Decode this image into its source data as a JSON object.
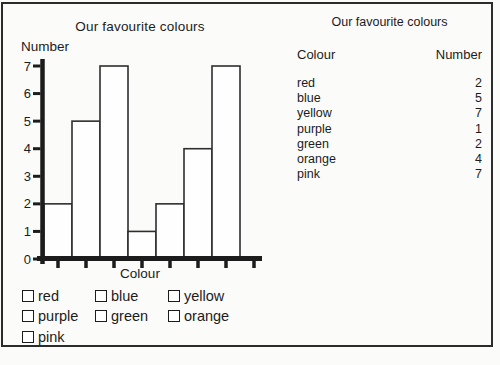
{
  "colors": {
    "ink": "#1c1c1c",
    "bar_fill": "#fefefe",
    "bar_stroke": "#2e2e2e",
    "paper": "#fbfbf9"
  },
  "chart_data": {
    "type": "bar",
    "title": "Our favourite colours",
    "xlabel": "Colour",
    "ylabel": "Number",
    "categories": [
      "red",
      "blue",
      "yellow",
      "purple",
      "green",
      "orange",
      "pink"
    ],
    "values": [
      2,
      5,
      7,
      1,
      2,
      4,
      7
    ],
    "ylim": [
      0,
      7
    ],
    "ytick_step": 1,
    "ytick_labels": [
      "0",
      "1",
      "2",
      "3",
      "4",
      "5",
      "6",
      "7"
    ],
    "grid": false,
    "legend_position": "below"
  },
  "legend": {
    "items": [
      "red",
      "blue",
      "yellow",
      "purple",
      "green",
      "orange",
      "pink"
    ]
  },
  "table": {
    "title": "Our favourite colours",
    "columns": [
      "Colour",
      "Number"
    ],
    "rows": [
      [
        "red",
        2
      ],
      [
        "blue",
        5
      ],
      [
        "yellow",
        7
      ],
      [
        "purple",
        1
      ],
      [
        "green",
        2
      ],
      [
        "orange",
        4
      ],
      [
        "pink",
        7
      ]
    ]
  }
}
